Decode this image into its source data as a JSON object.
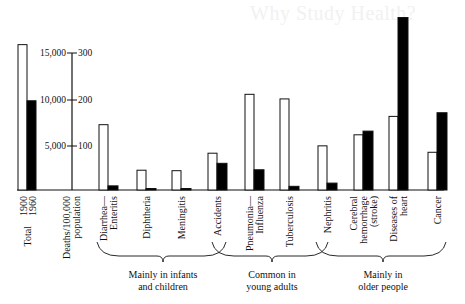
{
  "page": {
    "ghost_text": "Why Study Health?"
  },
  "axis": {
    "left_ticks": [
      "15,000",
      "10,000",
      "5,000"
    ],
    "right_ticks": [
      "300",
      "200",
      "100"
    ],
    "axis_label_line1": "Deaths/100,000",
    "axis_label_line2": "population",
    "total_label": "Total",
    "year_1900": "1900",
    "year_1960": "1960"
  },
  "groups": [
    {
      "line1": "Mainly in infants",
      "line2": "and children"
    },
    {
      "line1": "Common in",
      "line2": "young adults"
    },
    {
      "line1": "Mainly in",
      "line2": "older people"
    }
  ],
  "categories_display": [
    {
      "lines": [
        "Diarrhea—",
        "Enteritis"
      ]
    },
    {
      "lines": [
        "Diphtheria"
      ]
    },
    {
      "lines": [
        "Meningitis"
      ]
    },
    {
      "lines": [
        "Accidents"
      ]
    },
    {
      "lines": [
        "Pneumonia—",
        "Influenza"
      ]
    },
    {
      "lines": [
        "Tuberculosis"
      ]
    },
    {
      "lines": [
        "Nephritis"
      ]
    },
    {
      "lines": [
        "Cerebral",
        "hemorrhage",
        "(stroke)"
      ]
    },
    {
      "lines": [
        "Diseases of",
        "heart"
      ]
    },
    {
      "lines": [
        "Cancer"
      ]
    }
  ],
  "colors": {
    "bar_1900_fill": "#ffffff",
    "bar_1960_fill": "#000000",
    "stroke": "#111111"
  },
  "chart_data": {
    "type": "bar",
    "title": "",
    "xlabel": "",
    "ylabel": "Deaths/100,000 population",
    "y_left_scale": "Total deaths (left ticks 5,000 / 10,000 / 15,000)",
    "y_right_scale": "Deaths per 100,000 population (100 / 200 / 300)",
    "ylim_left": [
      0,
      18700
    ],
    "ylim_right": [
      0,
      375
    ],
    "grid": false,
    "legend": "Years labeled under Total bars: 1900 (white), 1960 (black)",
    "total": {
      "label": "Total",
      "1900": 15800,
      "1960": 9700
    },
    "categories": [
      "Diarrhea—Enteritis",
      "Diphtheria",
      "Meningitis",
      "Accidents",
      "Pneumonia—Influenza",
      "Tuberculosis",
      "Nephritis",
      "Cerebral hemorrhage (stroke)",
      "Diseases of heart",
      "Cancer"
    ],
    "series": [
      {
        "name": "1900",
        "color": "#ffffff",
        "values": [
          142,
          43,
          42,
          80,
          208,
          198,
          96,
          120,
          160,
          82
        ]
      },
      {
        "name": "1960",
        "color": "#000000",
        "values": [
          9,
          1,
          2,
          58,
          44,
          8,
          15,
          128,
          375,
          168
        ]
      }
    ],
    "groups": [
      {
        "label": "Mainly in infants and children",
        "categories": [
          "Diarrhea—Enteritis",
          "Diphtheria",
          "Meningitis",
          "Accidents"
        ]
      },
      {
        "label": "Common in young adults",
        "categories": [
          "Accidents",
          "Pneumonia—Influenza",
          "Tuberculosis",
          "Nephritis"
        ]
      },
      {
        "label": "Mainly in older people",
        "categories": [
          "Nephritis",
          "Cerebral hemorrhage (stroke)",
          "Diseases of heart",
          "Cancer"
        ]
      }
    ]
  }
}
